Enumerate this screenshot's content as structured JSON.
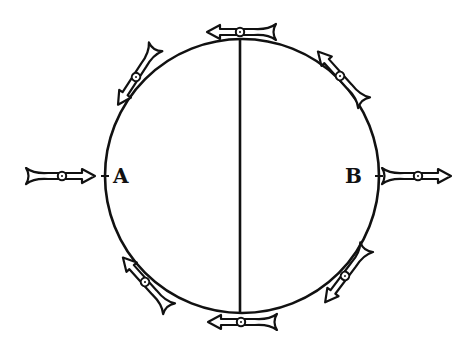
{
  "diagram": {
    "type": "magnetic needles around a circle",
    "circle": {
      "cx": 242,
      "cy": 176,
      "r": 137
    },
    "axis_line": {
      "x": 240,
      "y1": 39,
      "y2": 313
    },
    "labels": [
      {
        "id": "A",
        "text": "A",
        "x": 113,
        "y": 166
      },
      {
        "id": "B",
        "text": "B",
        "x": 345,
        "y": 166
      }
    ],
    "needles": [
      {
        "name": "needle-left-a",
        "cx": 62,
        "cy": 176,
        "angle": 0
      },
      {
        "name": "needle-right-b",
        "cx": 418,
        "cy": 176,
        "angle": 0
      },
      {
        "name": "needle-top",
        "cx": 240,
        "cy": 32,
        "angle": 180
      },
      {
        "name": "needle-bottom",
        "cx": 241,
        "cy": 322,
        "angle": 180
      },
      {
        "name": "needle-upper-left",
        "cx": 136,
        "cy": 77,
        "angle": 123
      },
      {
        "name": "needle-upper-right",
        "cx": 340,
        "cy": 76,
        "angle": 228
      },
      {
        "name": "needle-lower-left",
        "cx": 145,
        "cy": 282,
        "angle": 228
      },
      {
        "name": "needle-lower-right",
        "cx": 345,
        "cy": 276,
        "angle": 127
      }
    ],
    "colors": {
      "ink": "#111111",
      "paper": "#ffffff"
    }
  }
}
